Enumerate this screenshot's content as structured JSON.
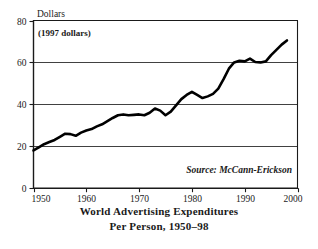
{
  "chart_data": {
    "type": "line",
    "title": "",
    "caption_line1": "World Advertising Expenditures",
    "caption_line2": "Per Person, 1950–98",
    "ylabel": "Dollars",
    "unit_note": "(1997 dollars)",
    "source": "Source: McCann-Erickson",
    "xlabel": "",
    "xlim": [
      1950,
      2000
    ],
    "ylim": [
      0,
      80
    ],
    "xticks": [
      1950,
      1960,
      1970,
      1980,
      1990,
      2000
    ],
    "xtick_labels": [
      "1950",
      "1960",
      "1970",
      "1980",
      "1990",
      "2000"
    ],
    "yticks": [
      0,
      20,
      40,
      60,
      80
    ],
    "ytick_labels": [
      "0",
      "20",
      "40",
      "60",
      "80"
    ],
    "grid": "horizontal",
    "gridlines_at": [
      20,
      40,
      60
    ],
    "legend": "none",
    "line_color": "#000000",
    "x": [
      1950,
      1951,
      1952,
      1953,
      1954,
      1955,
      1956,
      1957,
      1958,
      1959,
      1960,
      1961,
      1962,
      1963,
      1964,
      1965,
      1966,
      1967,
      1968,
      1969,
      1970,
      1971,
      1972,
      1973,
      1974,
      1975,
      1976,
      1977,
      1978,
      1979,
      1980,
      1981,
      1982,
      1983,
      1984,
      1985,
      1986,
      1987,
      1988,
      1989,
      1990,
      1991,
      1992,
      1993,
      1994,
      1995,
      1996,
      1997,
      1998
    ],
    "values": [
      18.0,
      19.5,
      21.0,
      22.0,
      23.0,
      24.5,
      26.0,
      25.8,
      25.0,
      26.5,
      27.5,
      28.2,
      29.5,
      30.5,
      32.0,
      33.5,
      34.8,
      35.2,
      34.8,
      35.0,
      35.2,
      34.8,
      36.0,
      38.0,
      37.0,
      34.8,
      36.5,
      39.5,
      42.5,
      44.5,
      46.0,
      44.5,
      43.0,
      43.8,
      45.0,
      47.5,
      52.0,
      57.0,
      60.0,
      60.8,
      60.5,
      61.8,
      60.2,
      60.0,
      60.5,
      63.5,
      66.0,
      68.5,
      70.5
    ]
  }
}
